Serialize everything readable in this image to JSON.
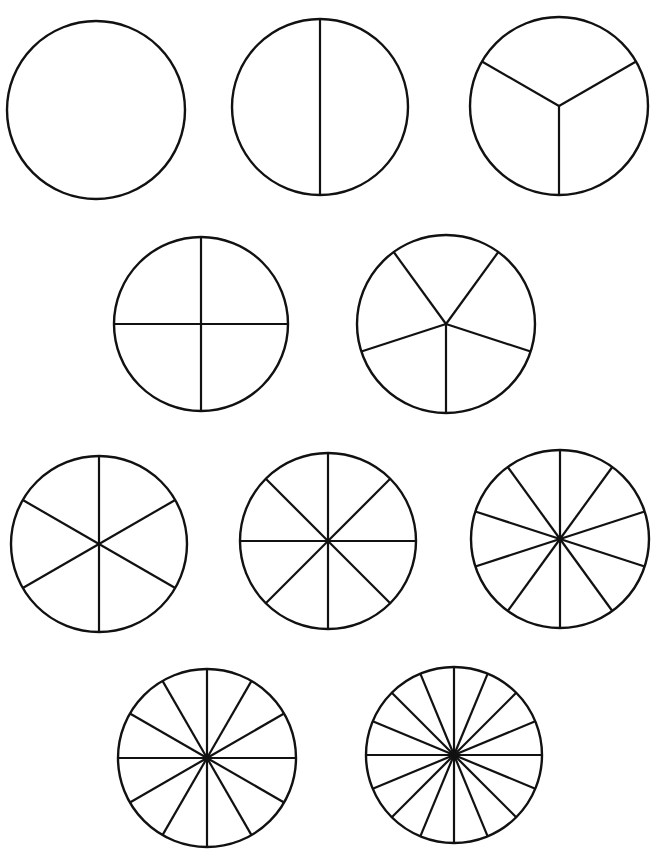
{
  "stroke_color": "#111111",
  "background": "#ffffff",
  "circles": [
    {
      "id": "whole",
      "slices": 1,
      "cx": 96,
      "cy": 110,
      "r": 89,
      "rotation": 0
    },
    {
      "id": "halves",
      "slices": 2,
      "cx": 320,
      "cy": 107,
      "r": 88,
      "rotation": 0
    },
    {
      "id": "thirds",
      "slices": 3,
      "cx": 559,
      "cy": 106,
      "r": 89,
      "rotation": 180
    },
    {
      "id": "fourths",
      "slices": 4,
      "cx": 201,
      "cy": 324,
      "r": 87,
      "rotation": 0
    },
    {
      "id": "fifths",
      "slices": 5,
      "cx": 446,
      "cy": 324,
      "r": 89,
      "rotation": 180
    },
    {
      "id": "sixths",
      "slices": 6,
      "cx": 99,
      "cy": 544,
      "r": 88,
      "rotation": 0
    },
    {
      "id": "eighths",
      "slices": 8,
      "cx": 328,
      "cy": 541,
      "r": 88,
      "rotation": 0
    },
    {
      "id": "tenths",
      "slices": 10,
      "cx": 560,
      "cy": 539,
      "r": 89,
      "rotation": 0
    },
    {
      "id": "twelfths",
      "slices": 12,
      "cx": 207,
      "cy": 758,
      "r": 89,
      "rotation": 0
    },
    {
      "id": "sixteenths",
      "slices": 16,
      "cx": 454,
      "cy": 755,
      "r": 88,
      "rotation": 0
    }
  ]
}
